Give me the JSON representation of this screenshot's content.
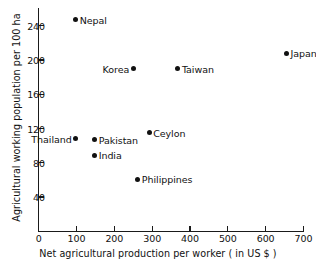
{
  "chart_data": {
    "type": "scatter",
    "title": "",
    "xlabel": "Net agricultural production per worker ( in US $ )",
    "ylabel": "Agricultural working population per 100 ha",
    "xlim": [
      0,
      700
    ],
    "ylim": [
      0,
      260
    ],
    "xticks": [
      0,
      100,
      200,
      300,
      400,
      500,
      600,
      700
    ],
    "xtick_labels": [
      "0",
      "100",
      "200",
      "300",
      "400",
      "500",
      "600",
      "700"
    ],
    "yticks": [
      40,
      80,
      120,
      160,
      200,
      240
    ],
    "ytick_labels": [
      "40",
      "80",
      "120",
      "160",
      "200",
      "240"
    ],
    "grid": false,
    "legend": false,
    "marker_color": "#111111",
    "axis_color": "#1a1a1a",
    "points": [
      {
        "name": "Nepal",
        "x": 98,
        "y": 247,
        "label_side": "right"
      },
      {
        "name": "Japan",
        "x": 655,
        "y": 208,
        "label_side": "right"
      },
      {
        "name": "Korea",
        "x": 250,
        "y": 190,
        "label_side": "left"
      },
      {
        "name": "Taiwan",
        "x": 368,
        "y": 190,
        "label_side": "right"
      },
      {
        "name": "Ceylon",
        "x": 292,
        "y": 115,
        "label_side": "right"
      },
      {
        "name": "Thailand",
        "x": 98,
        "y": 108,
        "label_side": "left"
      },
      {
        "name": "Pakistan",
        "x": 148,
        "y": 107,
        "label_side": "right"
      },
      {
        "name": "India",
        "x": 148,
        "y": 89,
        "label_side": "right"
      },
      {
        "name": "Philippines",
        "x": 262,
        "y": 61,
        "label_side": "right"
      }
    ]
  }
}
